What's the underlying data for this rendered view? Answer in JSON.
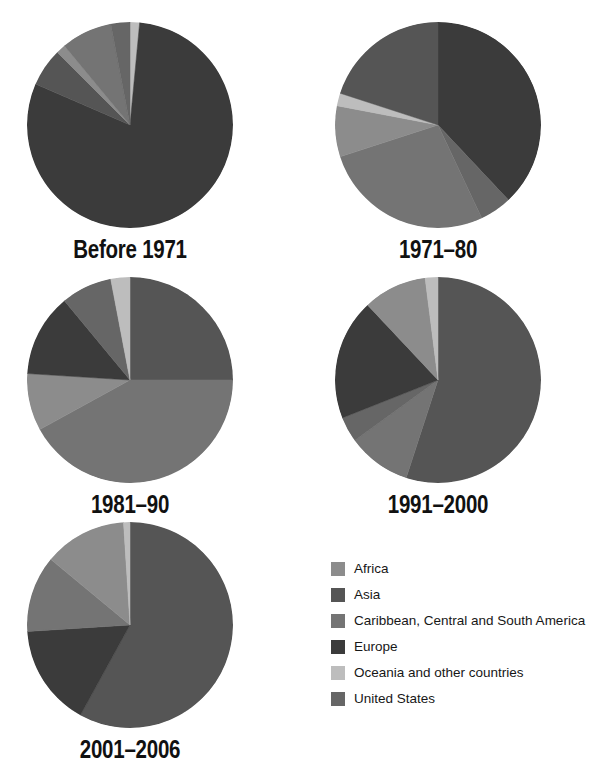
{
  "figure": {
    "background": "#ffffff",
    "type": "pie-chart-grid"
  },
  "palette": {
    "Africa": "#8c8c8c",
    "Asia": "#555555",
    "Caribbean, Central and South America": "#747474",
    "Europe": "#3b3b3b",
    "Oceania and other countries": "#bdbdbd",
    "United States": "#666666"
  },
  "legend": {
    "position": "bottom-right",
    "items": [
      {
        "label": "Africa",
        "color": "#8c8c8c"
      },
      {
        "label": "Asia",
        "color": "#555555"
      },
      {
        "label": "Caribbean, Central and South America",
        "color": "#747474"
      },
      {
        "label": "Europe",
        "color": "#3b3b3b"
      },
      {
        "label": "Oceania and other countries",
        "color": "#bdbdbd"
      },
      {
        "label": "United States",
        "color": "#666666"
      }
    ]
  },
  "chart_data": {
    "type": "pie",
    "title": "",
    "xlabel": "",
    "ylabel": "",
    "categories": [
      "Africa",
      "Asia",
      "Caribbean, Central and South America",
      "Europe",
      "Oceania and other countries",
      "United States"
    ],
    "colors": [
      "#8c8c8c",
      "#555555",
      "#747474",
      "#3b3b3b",
      "#bdbdbd",
      "#666666"
    ],
    "units": "percent",
    "charts": [
      {
        "title": "Before 1971",
        "radius_px": 103,
        "start_angle_deg": -90,
        "direction": "clockwise",
        "slices": [
          {
            "label": "Oceania and other countries",
            "value": 1.5,
            "color": "#bdbdbd"
          },
          {
            "label": "Europe",
            "value": 80.0,
            "color": "#3b3b3b"
          },
          {
            "label": "Asia",
            "value": 6.0,
            "color": "#555555"
          },
          {
            "label": "Africa",
            "value": 1.5,
            "color": "#8c8c8c"
          },
          {
            "label": "Caribbean, Central and South America",
            "value": 8.0,
            "color": "#747474"
          },
          {
            "label": "United States",
            "value": 3.0,
            "color": "#666666"
          }
        ]
      },
      {
        "title": "1971–80",
        "radius_px": 103,
        "start_angle_deg": -90,
        "direction": "clockwise",
        "slices": [
          {
            "label": "Europe",
            "value": 38.0,
            "color": "#3b3b3b"
          },
          {
            "label": "United States",
            "value": 5.0,
            "color": "#666666"
          },
          {
            "label": "Caribbean, Central and South America",
            "value": 27.0,
            "color": "#747474"
          },
          {
            "label": "Africa",
            "value": 8.0,
            "color": "#8c8c8c"
          },
          {
            "label": "Oceania and other countries",
            "value": 2.0,
            "color": "#bdbdbd"
          },
          {
            "label": "Asia",
            "value": 20.0,
            "color": "#555555"
          }
        ]
      },
      {
        "title": "1981–90",
        "radius_px": 103,
        "start_angle_deg": -90,
        "direction": "clockwise",
        "slices": [
          {
            "label": "Asia",
            "value": 25.0,
            "color": "#555555"
          },
          {
            "label": "Caribbean, Central and South America",
            "value": 42.0,
            "color": "#747474"
          },
          {
            "label": "Africa",
            "value": 9.0,
            "color": "#8c8c8c"
          },
          {
            "label": "Europe",
            "value": 13.0,
            "color": "#3b3b3b"
          },
          {
            "label": "United States",
            "value": 8.0,
            "color": "#666666"
          },
          {
            "label": "Oceania and other countries",
            "value": 3.0,
            "color": "#bdbdbd"
          }
        ]
      },
      {
        "title": "1991–2000",
        "radius_px": 103,
        "start_angle_deg": -90,
        "direction": "clockwise",
        "slices": [
          {
            "label": "Asia",
            "value": 55.0,
            "color": "#555555"
          },
          {
            "label": "Caribbean, Central and South America",
            "value": 10.0,
            "color": "#747474"
          },
          {
            "label": "United States",
            "value": 4.0,
            "color": "#666666"
          },
          {
            "label": "Europe",
            "value": 19.0,
            "color": "#3b3b3b"
          },
          {
            "label": "Africa",
            "value": 10.0,
            "color": "#8c8c8c"
          },
          {
            "label": "Oceania and other countries",
            "value": 2.0,
            "color": "#bdbdbd"
          }
        ]
      },
      {
        "title": "2001–2006",
        "radius_px": 103,
        "start_angle_deg": -90,
        "direction": "clockwise",
        "slices": [
          {
            "label": "Asia",
            "value": 58.0,
            "color": "#555555"
          },
          {
            "label": "Europe",
            "value": 16.0,
            "color": "#3b3b3b"
          },
          {
            "label": "Caribbean, Central and South America",
            "value": 12.0,
            "color": "#747474"
          },
          {
            "label": "Africa",
            "value": 13.0,
            "color": "#8c8c8c"
          },
          {
            "label": "Oceania and other countries",
            "value": 1.0,
            "color": "#bdbdbd"
          }
        ]
      }
    ]
  }
}
